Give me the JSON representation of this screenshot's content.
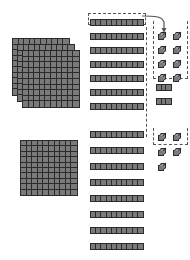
{
  "diagram": {
    "colors": {
      "block_fill": "#7a7a7a",
      "block_edge": "#2b2b2b",
      "cube_top": "#9a9a9a",
      "cube_side": "#8a8a8a",
      "dash_outline": "#555555",
      "background": "#ffffff"
    },
    "groups": [
      {
        "name": "hundreds-stack-top",
        "kind": "flat",
        "count": 3,
        "unit_value": 100,
        "total": 300,
        "label": ""
      },
      {
        "name": "hundreds-single-bottom",
        "kind": "flat",
        "count": 1,
        "unit_value": 100,
        "total": 100,
        "label": ""
      },
      {
        "name": "tens-column-top",
        "kind": "rod",
        "count": 7,
        "unit_value": 10,
        "total": 70,
        "label": ""
      },
      {
        "name": "tens-column-bottom",
        "kind": "rod",
        "count": 8,
        "unit_value": 10,
        "total": 80,
        "label": ""
      },
      {
        "name": "partial-rods-column",
        "kind": "minirod",
        "count": 7,
        "unit_value": 3,
        "total": 21,
        "label": ""
      },
      {
        "name": "ones-group-top",
        "kind": "cube",
        "count": 8,
        "unit_value": 1,
        "total": 8,
        "label": ""
      },
      {
        "name": "ones-group-bottom",
        "kind": "cube",
        "count": 5,
        "unit_value": 1,
        "total": 5,
        "label": ""
      }
    ],
    "annotations": {
      "regroup_outline_top_label": "",
      "regroup_outline_ones_label": "",
      "regroup_outline_bottom_label": "",
      "arrow_label": ""
    },
    "counts": {
      "flats_top": 3,
      "flats_bottom": 1,
      "rods_top": 7,
      "rods_bottom": 8,
      "minirods": 7,
      "cubes_top": 8,
      "cubes_bottom": 5,
      "flat_cells_per_row": 10,
      "flat_rows": 10,
      "rod_units": 10,
      "minirod_units": 3
    }
  }
}
